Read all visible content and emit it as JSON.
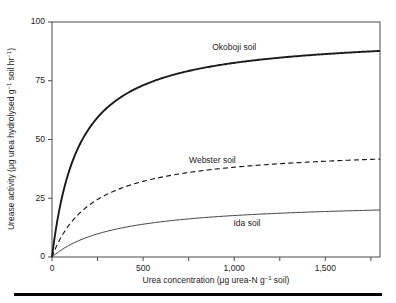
{
  "chart_data": {
    "type": "line",
    "title": "",
    "xlabel": "Urea concentration (μg urea-N g⁻¹ soil)",
    "ylabel": "Urease activity (μg urea hydrolysed g⁻¹ soil hr⁻¹)",
    "xlim": [
      0,
      1800
    ],
    "ylim": [
      0,
      100
    ],
    "grid": false,
    "legend_position": "inline-annotations",
    "model": "Michaelis-Menten saturation kinetics",
    "xticks": [
      0,
      250,
      500,
      750,
      1000,
      1250,
      1500,
      1750
    ],
    "xticklabels": [
      "0",
      "",
      "500",
      "",
      "1,000",
      "",
      "1,500",
      ""
    ],
    "yticks": [
      0,
      25,
      50,
      75,
      100
    ],
    "yticklabels": [
      "0",
      "25",
      "50",
      "75",
      "100"
    ],
    "x": [
      0,
      50,
      100,
      150,
      200,
      250,
      300,
      400,
      500,
      600,
      700,
      800,
      900,
      1000,
      1100,
      1200,
      1300,
      1400,
      1500,
      1600,
      1700,
      1800
    ],
    "series": [
      {
        "name": "Okoboji soil",
        "style": "solid-thick",
        "vmax": 95,
        "km": 150,
        "label_x": 1000,
        "label_y": 88,
        "values": [
          0,
          23.8,
          38.0,
          47.5,
          54.3,
          59.4,
          63.3,
          69.1,
          73.1,
          76.0,
          78.2,
          80.0,
          81.4,
          82.6,
          83.6,
          84.4,
          85.2,
          85.8,
          86.4,
          86.9,
          87.3,
          87.7
        ]
      },
      {
        "name": "Webster soil",
        "style": "dashed",
        "vmax": 47,
        "km": 230,
        "label_x": 880,
        "label_y": 40,
        "values": [
          0,
          8.4,
          14.2,
          18.6,
          21.9,
          24.5,
          26.6,
          29.8,
          32.0,
          33.7,
          35.0,
          36.1,
          36.9,
          37.6,
          38.2,
          38.7,
          39.2,
          39.5,
          39.9,
          40.2,
          40.5,
          40.7
        ]
      },
      {
        "name": "Ida soil",
        "style": "solid-thin",
        "vmax": 24,
        "km": 360,
        "label_x": 1070,
        "label_y": 13,
        "values": [
          0,
          2.9,
          5.2,
          7.1,
          8.6,
          9.8,
          10.9,
          12.6,
          13.9,
          15.0,
          15.8,
          16.6,
          17.1,
          17.6,
          18.1,
          18.5,
          18.8,
          19.1,
          19.4,
          19.6,
          19.8,
          20.0
        ]
      }
    ]
  },
  "axis": {
    "y_label_main": "Urease activity (",
    "y_label_unit1": "μg urea hydrolysed g",
    "y_label_sup1": "−1",
    "y_label_unit2": " soil hr",
    "y_label_sup2": "−1",
    "y_label_close": ")",
    "x_label_main": "Urea concentration (",
    "x_label_unit1": "μg urea-N g",
    "x_label_sup1": "−1",
    "x_label_unit2": " soil",
    "x_label_close": ")"
  },
  "colors": {
    "curve": "#1a1a1a",
    "axis": "#4a4a4a",
    "background": "#ffffff",
    "rule": "#000000"
  }
}
